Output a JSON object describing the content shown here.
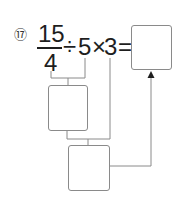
{
  "problem": {
    "number": "⑰",
    "fraction": {
      "numerator": "15",
      "denominator": "4"
    },
    "div_op": "÷",
    "divisor": "5",
    "mul_op": "×",
    "multiplier": "3",
    "equals": "="
  },
  "answer_boxes": {
    "step1": "",
    "step2": "",
    "final": ""
  },
  "colors": {
    "text": "#1e1e1e",
    "lines": "#8a8a8a"
  }
}
